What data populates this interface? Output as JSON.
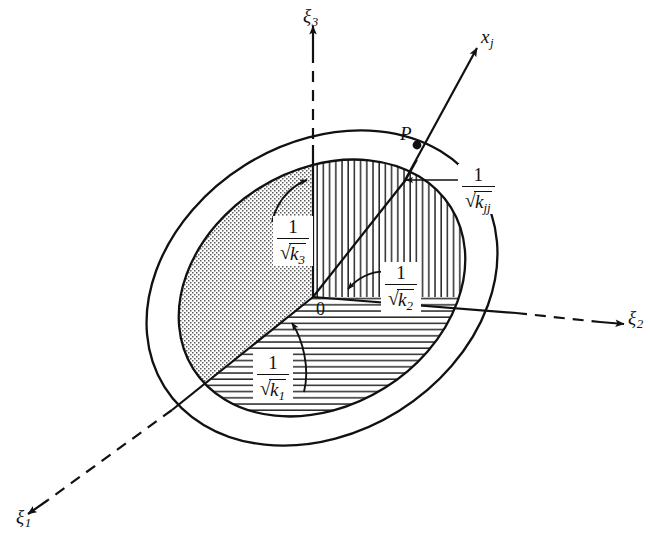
{
  "figure": {
    "background_color": "#ffffff",
    "ink_color": "#111111",
    "axes": [
      {
        "id": "xi1",
        "symbol": "ξ",
        "subscript": "1",
        "style": "dashed",
        "direction": "down-left"
      },
      {
        "id": "xi2",
        "symbol": "ξ",
        "subscript": "2",
        "style": "dashed",
        "direction": "right"
      },
      {
        "id": "xi3",
        "symbol": "ξ",
        "subscript": "3",
        "style": "dashed",
        "direction": "up"
      },
      {
        "id": "xj",
        "symbol": "x",
        "subscript": "j",
        "style": "solid",
        "direction": "up-right"
      }
    ],
    "origin_label": "0",
    "point_label": "P",
    "annotations": [
      {
        "id": "k1",
        "numerator": "1",
        "radicand": "k",
        "radicand_sub": "1",
        "region": "horizontal-hatch"
      },
      {
        "id": "k2",
        "numerator": "1",
        "radicand": "k",
        "radicand_sub": "2",
        "region": "vertical-hatch"
      },
      {
        "id": "k3",
        "numerator": "1",
        "radicand": "k",
        "radicand_sub": "3",
        "region": "stipple"
      },
      {
        "id": "kjj",
        "numerator": "1",
        "radicand": "k",
        "radicand_sub": "jj",
        "region": "outside-right"
      }
    ],
    "radical_symbol": "√",
    "regions": [
      {
        "id": "stipple-region",
        "fill": "dotted",
        "between_axes": "xi1-xi3"
      },
      {
        "id": "vertical-hatch-region",
        "fill": "vertical-lines",
        "between_axes": "xi2-xi3"
      },
      {
        "id": "horizontal-hatch-region",
        "fill": "horizontal-lines",
        "between_axes": "xi1-xi2"
      }
    ]
  }
}
